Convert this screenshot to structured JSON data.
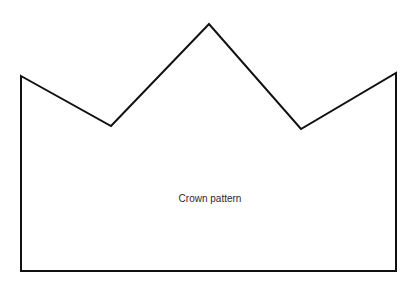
{
  "diagram": {
    "title": "Crown pattern",
    "outline_color": "#111111",
    "outline_points": [
      [
        21,
        76
      ],
      [
        111,
        126
      ],
      [
        209,
        24
      ],
      [
        301,
        129
      ],
      [
        396,
        73
      ],
      [
        396,
        271
      ],
      [
        21,
        271
      ]
    ]
  }
}
